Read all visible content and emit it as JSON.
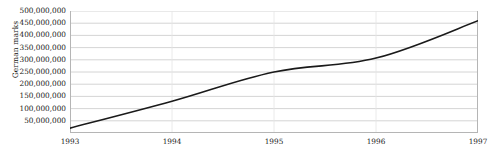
{
  "chart_data": {
    "type": "line",
    "title": "",
    "subtitle": "",
    "xlabel": "",
    "ylabel": "German marks",
    "x": [
      1993,
      1994,
      1995,
      1996,
      1997
    ],
    "x_tick_labels": [
      "1993",
      "1994",
      "1995",
      "1996",
      "1997"
    ],
    "series": [
      {
        "name": "German marks",
        "values": [
          20000000,
          130000000,
          250000000,
          307000000,
          460000000
        ],
        "color": "#1a1a1a"
      }
    ],
    "y_tick_labels": [
      "500,000,000",
      "450,000,000",
      "400,000,000",
      "350,000,000",
      "300,000,000",
      "250,000,000",
      "200,000,000",
      "150,000,000",
      "100,000,000",
      "50,000,000"
    ],
    "y_tick_values": [
      500000000,
      450000000,
      400000000,
      350000000,
      300000000,
      250000000,
      200000000,
      150000000,
      100000000,
      50000000
    ],
    "ylim": [
      0,
      500000000
    ],
    "xlim": [
      1993,
      1997
    ],
    "grid": {
      "horizontal": true,
      "vertical": true,
      "horizontal_color": "#c9c9c9",
      "vertical_color": "#e4e4e4"
    },
    "legend": {
      "visible": false,
      "position": "none"
    },
    "axis_line_color": "#b5b5b5",
    "background_color": "#ffffff",
    "line_width": 1.6
  }
}
